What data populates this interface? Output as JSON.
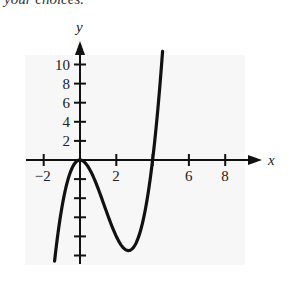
{
  "header": {
    "clipped_text": "your choices."
  },
  "chart_data": {
    "type": "line",
    "title": "",
    "xlabel": "x",
    "ylabel": "y",
    "x_ticks": [
      -2,
      0,
      2,
      4,
      6,
      8
    ],
    "x_tick_labels": [
      "-2",
      "2",
      "6",
      "8"
    ],
    "y_ticks": [
      -10,
      -8,
      -6,
      -4,
      -2,
      2,
      4,
      6,
      8,
      10
    ],
    "y_tick_labels": [
      "10",
      "8",
      "6",
      "4",
      "2"
    ],
    "xlim": [
      -2.5,
      9.5
    ],
    "ylim": [
      -11,
      12
    ],
    "grid": false,
    "series": [
      {
        "name": "y = x^3 - 4x^2",
        "x": [
          -1.4,
          -1.0,
          -0.5,
          0,
          0.5,
          1.0,
          1.5,
          2.0,
          2.67,
          3.0,
          3.5,
          4.0,
          4.3,
          4.55
        ],
        "y": [
          -10.6,
          -5.0,
          -1.1,
          0,
          -0.9,
          -3.0,
          -5.6,
          -8.0,
          -9.5,
          -9.0,
          -6.1,
          0,
          5.5,
          11.4
        ]
      }
    ],
    "annotations": [
      "local max at (0, 0)",
      "local min near (2.67, -9.5)",
      "x-intercept at 4"
    ]
  }
}
